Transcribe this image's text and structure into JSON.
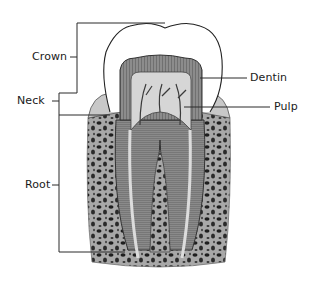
{
  "diagram": {
    "labels": {
      "crown": "Crown",
      "neck": "Neck",
      "root": "Root",
      "dentin": "Dentin",
      "pulp": "Pulp"
    },
    "colors": {
      "line": "#2a2a2a",
      "enamel": "#ffffff",
      "dentin": "#7a7a7a",
      "pulp": "#cfcfcf",
      "bone": "#9a9a9a",
      "gum": "#b5b5b5"
    }
  }
}
